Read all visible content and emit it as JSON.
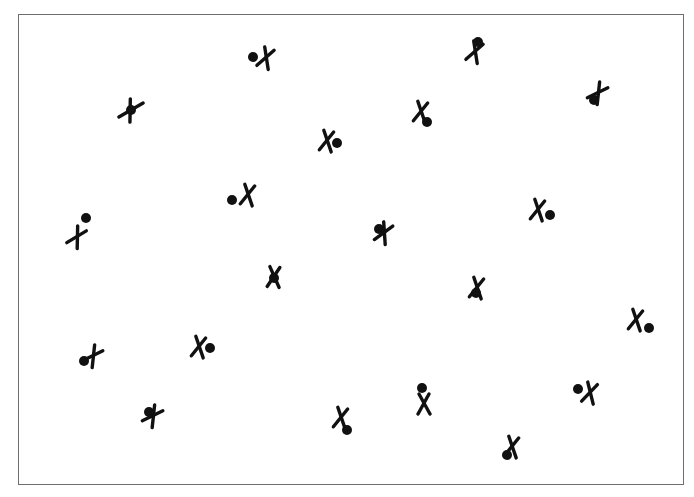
{
  "figure": {
    "background": "#ffffff",
    "frame_color": "#6e6e6e",
    "marker_color": "#111111",
    "frame": {
      "x": 18,
      "y": 14,
      "width": 666,
      "height": 471
    },
    "markers": [
      {
        "x_mark": [
          266,
          58
        ],
        "x_angle": 20,
        "dot": [
          253,
          57
        ]
      },
      {
        "x_mark": [
          131,
          110
        ],
        "x_angle": 60,
        "dot": [
          131,
          110
        ],
        "variant": "plus"
      },
      {
        "x_mark": [
          475,
          52
        ],
        "x_angle": 20,
        "dot": [
          478,
          42
        ]
      },
      {
        "x_mark": [
          598,
          93
        ],
        "x_angle": 35,
        "dot": [
          594,
          100
        ]
      },
      {
        "x_mark": [
          421,
          112
        ],
        "x_angle": 10,
        "dot": [
          427,
          122
        ]
      },
      {
        "x_mark": [
          327,
          141
        ],
        "x_angle": 10,
        "dot": [
          337,
          143
        ]
      },
      {
        "x_mark": [
          248,
          195
        ],
        "x_angle": 10,
        "dot": [
          232,
          200
        ]
      },
      {
        "x_mark": [
          77,
          237
        ],
        "x_angle": 30,
        "dot": [
          86,
          218
        ]
      },
      {
        "x_mark": [
          384,
          233
        ],
        "x_angle": 25,
        "dot": [
          379,
          229
        ]
      },
      {
        "x_mark": [
          538,
          210
        ],
        "x_angle": 10,
        "dot": [
          550,
          215
        ]
      },
      {
        "x_mark": [
          274,
          277
        ],
        "x_angle": 5,
        "dot": [
          274,
          278
        ]
      },
      {
        "x_mark": [
          477,
          288
        ],
        "x_angle": 10,
        "dot": [
          476,
          293
        ]
      },
      {
        "x_mark": [
          636,
          320
        ],
        "x_angle": 10,
        "dot": [
          649,
          328
        ]
      },
      {
        "x_mark": [
          93,
          356
        ],
        "x_angle": 35,
        "dot": [
          84,
          361
        ]
      },
      {
        "x_mark": [
          199,
          347
        ],
        "x_angle": 10,
        "dot": [
          210,
          348
        ]
      },
      {
        "x_mark": [
          153,
          416
        ],
        "x_angle": 35,
        "dot": [
          149,
          412
        ]
      },
      {
        "x_mark": [
          341,
          418
        ],
        "x_angle": 10,
        "dot": [
          347,
          430
        ]
      },
      {
        "x_mark": [
          424,
          404
        ],
        "x_angle": 0,
        "dot": [
          422,
          388
        ]
      },
      {
        "x_mark": [
          590,
          393
        ],
        "x_angle": 15,
        "dot": [
          578,
          389
        ]
      },
      {
        "x_mark": [
          512,
          447
        ],
        "x_angle": 10,
        "dot": [
          507,
          455
        ]
      }
    ]
  }
}
